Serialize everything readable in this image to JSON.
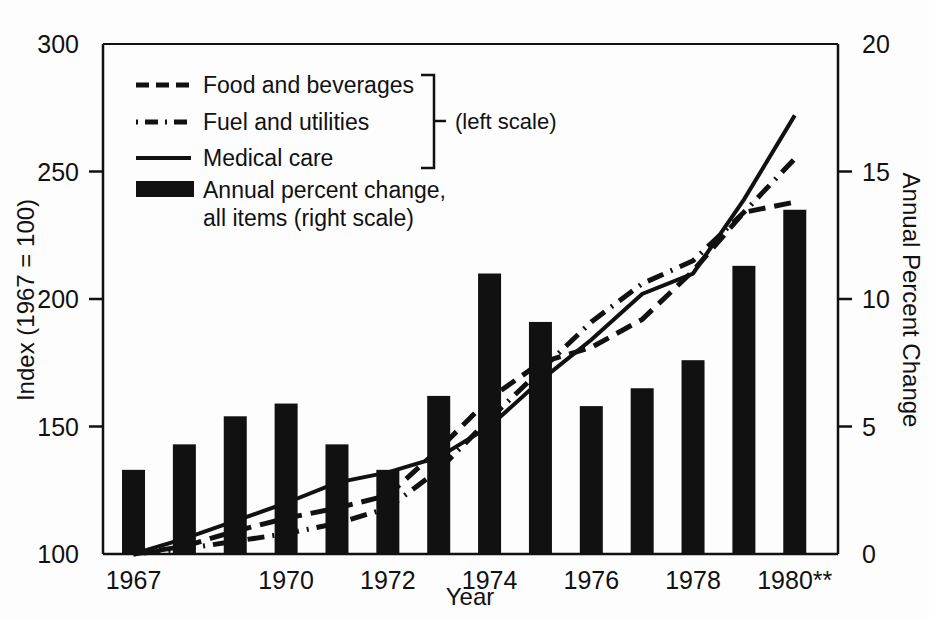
{
  "chart_data": {
    "type": "bar",
    "title": "",
    "subtitle": "",
    "xlabel": "Year",
    "ylabel": "Index (1967 = 100)",
    "y2label": "Annual Percent Change",
    "grid": false,
    "legend_position": "top-left-inside",
    "x": [
      1967,
      1968,
      1969,
      1970,
      1971,
      1972,
      1973,
      1974,
      1975,
      1976,
      1977,
      1978,
      1979,
      1980
    ],
    "categories": [
      "1967",
      "1968",
      "1969",
      "1970",
      "1971",
      "1972",
      "1973",
      "1974",
      "1975",
      "1976",
      "1977",
      "1978",
      "1979",
      "1980**"
    ],
    "xtick_labels": [
      "1967",
      "1970",
      "1972",
      "1974",
      "1976",
      "1978",
      "1980**"
    ],
    "xtick_values": [
      1967,
      1970,
      1972,
      1974,
      1976,
      1978,
      1980
    ],
    "ylim": [
      100,
      300
    ],
    "ytick_labels": [
      "100",
      "150",
      "200",
      "250",
      "300"
    ],
    "ytick_values": [
      100,
      150,
      200,
      250,
      300
    ],
    "y2lim": [
      0,
      20
    ],
    "y2tick_labels": [
      "0",
      "5",
      "10",
      "15",
      "20"
    ],
    "y2tick_values": [
      0,
      5,
      10,
      15,
      20
    ],
    "bars": {
      "name": "Annual percent change, all items",
      "axis": "right",
      "values": [
        3.3,
        4.3,
        5.4,
        5.9,
        4.3,
        3.3,
        6.2,
        11.0,
        9.1,
        5.8,
        6.5,
        7.6,
        11.3,
        13.5
      ]
    },
    "series": [
      {
        "name": "Food and beverages",
        "axis": "left",
        "style": "dashed",
        "x": [
          1967,
          1968,
          1969,
          1970,
          1971,
          1972,
          1973,
          1974,
          1975,
          1976,
          1977,
          1978,
          1979,
          1980
        ],
        "values": [
          100,
          103,
          109,
          114,
          118,
          123,
          141,
          161,
          175,
          181,
          192,
          211,
          234,
          238
        ]
      },
      {
        "name": "Fuel and utilities",
        "axis": "left",
        "style": "dash-dot",
        "x": [
          1967,
          1968,
          1969,
          1970,
          1971,
          1972,
          1973,
          1974,
          1975,
          1976,
          1977,
          1978,
          1979,
          1980
        ],
        "values": [
          100,
          102,
          105,
          108,
          112,
          118,
          133,
          153,
          172,
          191,
          206,
          215,
          234,
          255
        ]
      },
      {
        "name": "Medical care",
        "axis": "left",
        "style": "solid",
        "x": [
          1967,
          1968,
          1969,
          1970,
          1971,
          1972,
          1973,
          1974,
          1975,
          1976,
          1977,
          1978,
          1979,
          1980
        ],
        "values": [
          100,
          106,
          113,
          120,
          128,
          132,
          138,
          150,
          168,
          184,
          202,
          210,
          239,
          272
        ]
      }
    ]
  },
  "legend": {
    "items": [
      {
        "label": "Food and beverages",
        "style": "dashed"
      },
      {
        "label": "Fuel and utilities",
        "style": "dash-dot"
      },
      {
        "label": "Medical care",
        "style": "solid"
      },
      {
        "label": "Annual percent change,",
        "label2": "all items (right scale)",
        "style": "bar"
      }
    ],
    "bracket_note": "(left scale)"
  }
}
